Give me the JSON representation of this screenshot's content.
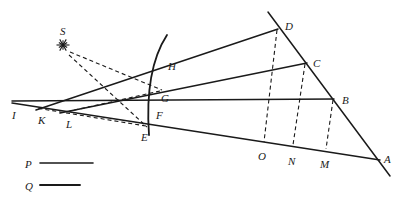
{
  "figure": {
    "width": 400,
    "height": 200,
    "background_color": "#ffffff",
    "ink_color": "#1a1a1a"
  },
  "source": {
    "label": "S",
    "icon": "starburst-light-source-icon",
    "x": 63,
    "y": 45,
    "label_x": 60,
    "label_y": 26
  },
  "points": [
    {
      "id": "A",
      "label": "A",
      "x": 376,
      "y": 157,
      "label_x": 384,
      "label_y": 154
    },
    {
      "id": "B",
      "label": "B",
      "x": 333,
      "y": 99,
      "label_x": 342,
      "label_y": 95
    },
    {
      "id": "C",
      "label": "C",
      "x": 306,
      "y": 63,
      "label_x": 313,
      "label_y": 58
    },
    {
      "id": "D",
      "label": "D",
      "x": 277,
      "y": 29,
      "label_x": 285,
      "label_y": 21
    },
    {
      "id": "E",
      "label": "E",
      "x": 146,
      "y": 126,
      "label_x": 141,
      "label_y": 132
    },
    {
      "id": "F",
      "label": "F",
      "x": 155,
      "y": 106,
      "label_x": 156,
      "label_y": 110
    },
    {
      "id": "G",
      "label": "G",
      "x": 159,
      "y": 92,
      "label_x": 161,
      "label_y": 93
    },
    {
      "id": "H",
      "label": "H",
      "x": 164,
      "y": 63,
      "label_x": 168,
      "label_y": 61
    },
    {
      "id": "I",
      "label": "I",
      "x": 12,
      "y": 104,
      "label_x": 12,
      "label_y": 110
    },
    {
      "id": "K",
      "label": "K",
      "x": 40,
      "y": 108,
      "label_x": 38,
      "label_y": 115
    },
    {
      "id": "L",
      "label": "L",
      "x": 68,
      "y": 111,
      "label_x": 66,
      "label_y": 119
    },
    {
      "id": "M",
      "label": "M",
      "x": 325,
      "y": 150,
      "label_x": 320,
      "label_y": 159
    },
    {
      "id": "N",
      "label": "N",
      "x": 292,
      "y": 146,
      "label_x": 288,
      "label_y": 156
    },
    {
      "id": "O",
      "label": "O",
      "x": 263,
      "y": 143,
      "label_x": 258,
      "label_y": 151
    }
  ],
  "solid_lines": [
    {
      "name": "ray-I-to-A-lower",
      "x1": 12,
      "y1": 103,
      "x2": 380,
      "y2": 160
    },
    {
      "name": "ray-I-to-B-horizontal",
      "x1": 12,
      "y1": 101,
      "x2": 334,
      "y2": 99
    },
    {
      "name": "ray-L-to-C",
      "x1": 60,
      "y1": 113,
      "x2": 307,
      "y2": 63
    },
    {
      "name": "ray-K-to-D",
      "x1": 36,
      "y1": 110,
      "x2": 278,
      "y2": 29
    },
    {
      "name": "line-D-to-A-mirror-edge",
      "x1": 268,
      "y1": 12,
      "x2": 390,
      "y2": 176
    }
  ],
  "curve": {
    "name": "curved-mirror-arc",
    "path": "M 167,35 C 152,58 146,92 149,135",
    "through_points": [
      "H",
      "G",
      "F",
      "E"
    ]
  },
  "dashed_lines": [
    {
      "name": "ray-S-to-G-dashed",
      "x1": 70,
      "y1": 52,
      "x2": 162,
      "y2": 90
    },
    {
      "name": "ray-S-to-E-dashed",
      "x1": 69,
      "y1": 55,
      "x2": 147,
      "y2": 127
    },
    {
      "name": "ray-G-to-L-dashed",
      "x1": 160,
      "y1": 91,
      "x2": 66,
      "y2": 112
    },
    {
      "name": "ray-E-to-K-dashed",
      "x1": 146,
      "y1": 126,
      "x2": 36,
      "y2": 108
    },
    {
      "name": "drop-D-to-O-dashed",
      "x1": 277,
      "y1": 30,
      "x2": 264,
      "y2": 142
    },
    {
      "name": "drop-C-to-N-dashed",
      "x1": 305,
      "y1": 64,
      "x2": 293,
      "y2": 145
    },
    {
      "name": "drop-B-to-M-dashed",
      "x1": 333,
      "y1": 100,
      "x2": 326,
      "y2": 149
    }
  ],
  "legend": {
    "items": [
      {
        "id": "P",
        "label": "P",
        "label_x": 25,
        "label_y": 159,
        "line_x1": 40,
        "line_y1": 163,
        "line_x2": 93,
        "line_y2": 163,
        "thickness": 1.6
      },
      {
        "id": "Q",
        "label": "Q",
        "label_x": 25,
        "label_y": 181,
        "line_x1": 40,
        "line_y1": 185,
        "line_x2": 80,
        "line_y2": 185,
        "thickness": 1.9
      }
    ]
  }
}
